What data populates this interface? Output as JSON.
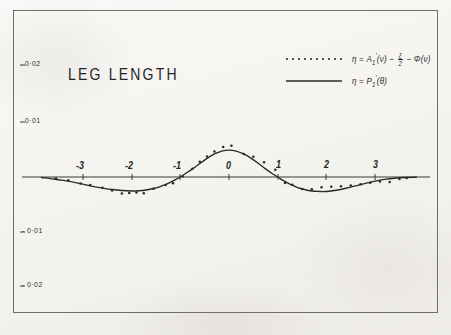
{
  "figure": {
    "title": "LEG LENGTH",
    "background_color": "#f4f2ee",
    "ink_color": "#2b2927",
    "frame_color": "#6f6d6a"
  },
  "legend": {
    "position": "top-right",
    "entries": [
      {
        "marker": "dotted",
        "name": "observed-series",
        "eq_lhs": "η",
        "eq_equals": "=",
        "eq_term1_base": "A",
        "eq_term1_sub": "1",
        "eq_term1_prime": "′",
        "eq_term1_arg": "(ν)",
        "eq_minus1": "−",
        "eq_frac_num": "ξ",
        "eq_frac_den": "2",
        "eq_minus2": "−",
        "eq_term3_base": "Φ",
        "eq_term3_arg": "(ν)",
        "eq_full": "η = A₁′(ν) − ξ/2 − Φ(ν)"
      },
      {
        "marker": "solid",
        "name": "theoretical-curve",
        "eq_lhs": "η",
        "eq_equals": "=",
        "eq_term1_base": "P",
        "eq_term1_sub": "1",
        "eq_term1_prime": "′",
        "eq_term1_arg": "(θ)",
        "eq_full": "η = P₁′(θ)"
      }
    ]
  },
  "chart_data": {
    "type": "line",
    "title": "LEG LENGTH",
    "xlabel": "",
    "ylabel": "",
    "grid": false,
    "legend_position": "top-right",
    "xlim": [
      -3.85,
      3.85
    ],
    "ylim": [
      -0.026,
      0.0245
    ],
    "x_ticks": [
      -3,
      -2,
      -1,
      0,
      1,
      2,
      3
    ],
    "x_tick_labels": [
      "-3",
      "-2",
      "-1",
      "0",
      "1",
      "2",
      "3"
    ],
    "y_ticks": [
      0.02,
      0.01,
      -0.01,
      -0.02
    ],
    "y_tick_labels": [
      "0·02",
      "0·01",
      "- 0·01",
      "- 0·02"
    ],
    "zero_axis": true,
    "series": [
      {
        "name": "η = P₁′(θ)",
        "style": "solid",
        "x": [
          -3.85,
          -3.6,
          -3.4,
          -3.2,
          -3.0,
          -2.8,
          -2.6,
          -2.4,
          -2.2,
          -2.0,
          -1.85,
          -1.7,
          -1.55,
          -1.4,
          -1.25,
          -1.1,
          -1.0,
          -0.9,
          -0.75,
          -0.6,
          -0.45,
          -0.3,
          -0.15,
          0.0,
          0.15,
          0.3,
          0.45,
          0.6,
          0.75,
          0.9,
          1.0,
          1.1,
          1.25,
          1.4,
          1.55,
          1.7,
          1.85,
          2.0,
          2.2,
          2.4,
          2.6,
          2.8,
          3.0,
          3.2,
          3.4,
          3.6,
          3.85
        ],
        "y": [
          -0.0002,
          -0.0008,
          -0.0014,
          -0.0021,
          -0.0029,
          -0.0038,
          -0.0045,
          -0.0051,
          -0.0055,
          -0.0057,
          -0.0056,
          -0.0053,
          -0.0047,
          -0.0038,
          -0.0026,
          -0.0011,
          0.0,
          0.0013,
          0.0033,
          0.0055,
          0.0076,
          0.0094,
          0.0106,
          0.011,
          0.0106,
          0.0094,
          0.0077,
          0.0056,
          0.0033,
          0.0012,
          0.0,
          -0.0013,
          -0.0029,
          -0.0042,
          -0.0051,
          -0.0057,
          -0.0059,
          -0.0059,
          -0.0054,
          -0.0046,
          -0.0036,
          -0.0026,
          -0.0017,
          -0.001,
          -0.0005,
          -0.0002,
          -0.0001
        ]
      },
      {
        "name": "η = A₁′(ν) − ξ/2 − Φ(ν)",
        "style": "points",
        "x": [
          -3.55,
          -3.3,
          -3.05,
          -2.85,
          -2.6,
          -2.4,
          -2.2,
          -2.05,
          -1.9,
          -1.75,
          -1.55,
          -1.3,
          -1.15,
          -0.95,
          -0.75,
          -0.6,
          -0.45,
          -0.3,
          -0.12,
          0.05,
          0.3,
          0.5,
          0.72,
          0.95,
          1.15,
          1.3,
          1.5,
          1.7,
          1.9,
          2.1,
          2.3,
          2.5,
          2.7,
          2.9,
          3.1,
          3.3,
          3.5,
          3.65
        ],
        "y": [
          -0.0006,
          -0.0013,
          -0.0027,
          -0.0033,
          -0.0044,
          -0.0055,
          -0.0067,
          -0.0065,
          -0.0063,
          -0.0066,
          -0.0048,
          -0.0033,
          -0.0026,
          0.0003,
          0.0034,
          0.0062,
          0.0084,
          0.0104,
          0.0122,
          0.0128,
          0.0094,
          0.0083,
          0.006,
          0.003,
          -0.0024,
          -0.0032,
          -0.0049,
          -0.005,
          -0.0042,
          -0.004,
          -0.0038,
          -0.0035,
          -0.003,
          -0.0023,
          -0.0018,
          -0.002,
          -0.0008,
          -0.0004
        ]
      }
    ]
  },
  "axes_geometry": {
    "x_pixel_at_minus3": 83,
    "x_pixel_at_0": 229,
    "x_pixel_per_unit": 48.7,
    "y_pixel_at_zero": 177,
    "y_pixel_per_unit": 2450
  }
}
